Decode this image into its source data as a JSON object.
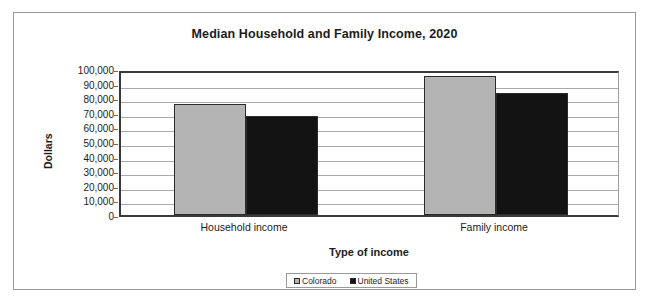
{
  "chart_data": {
    "type": "bar",
    "title": "Median Household and Family Income, 2020",
    "xlabel": "Type of income",
    "ylabel": "Dollars",
    "categories": [
      "Household income",
      "Family income"
    ],
    "series": [
      {
        "name": "Colorado",
        "color": "#b4b4b4",
        "values": [
          76000,
          95000
        ]
      },
      {
        "name": "United States",
        "color": "#131313",
        "values": [
          68000,
          83500
        ]
      }
    ],
    "ylim": [
      0,
      100000
    ],
    "ytick_labels": [
      "100,000",
      "90,000",
      "80,000",
      "70,000",
      "60,000",
      "50,000",
      "40,000",
      "30,000",
      "20,000",
      "10,000",
      "0"
    ],
    "ytick_values": [
      100000,
      90000,
      80000,
      70000,
      60000,
      50000,
      40000,
      30000,
      20000,
      10000,
      0
    ],
    "grid": true,
    "legend_position": "bottom"
  },
  "legend": {
    "items": [
      {
        "label": "Colorado"
      },
      {
        "label": "United States"
      }
    ]
  }
}
